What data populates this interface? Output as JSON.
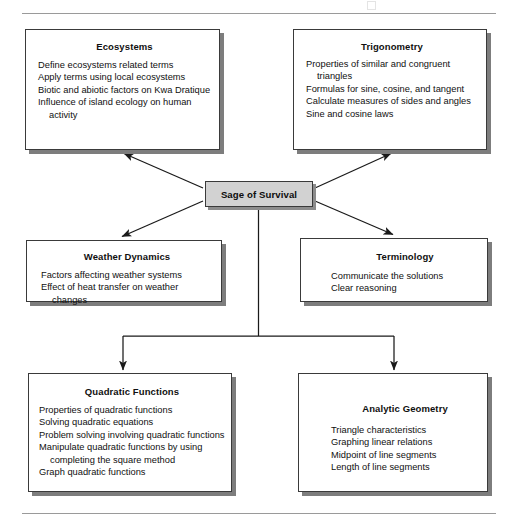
{
  "page": {
    "rules": {
      "top": true,
      "bottom": true
    }
  },
  "diagram": {
    "type": "concept-map",
    "center": {
      "id": "center",
      "label": "Sage of Survival",
      "fill": "#d2d2d2",
      "border": "#3a3a3a"
    },
    "nodes": [
      {
        "id": "ecosystems",
        "title": "Ecosystems",
        "items": [
          "Define ecosystems related terms",
          "Apply terms using local ecosystems",
          "Biotic and abiotic factors on Kwa Dratique",
          "Influence of island ecology on human activity"
        ]
      },
      {
        "id": "trigonometry",
        "title": "Trigonometry",
        "items": [
          "Properties of similar and congruent triangles",
          "Formulas for sine, cosine, and tangent",
          "Calculate measures of sides and angles",
          "Sine and cosine laws"
        ]
      },
      {
        "id": "weather",
        "title": "Weather Dynamics",
        "items": [
          "Factors affecting weather systems",
          "Effect of heat transfer on weather changes"
        ]
      },
      {
        "id": "terminology",
        "title": "Terminology",
        "items": [
          "Communicate the solutions",
          "Clear reasoning"
        ]
      },
      {
        "id": "quadratic",
        "title": "Quadratic Functions",
        "items": [
          "Properties of quadratic functions",
          "Solving quadratic equations",
          "Problem solving involving quadratic functions",
          "Manipulate quadratic functions by using completing the square method",
          "Graph quadratic functions"
        ]
      },
      {
        "id": "analytic",
        "title": "Analytic Geometry",
        "items": [
          "Triangle characteristics",
          "Graphing linear relations",
          "Midpoint of line segments",
          "Length of line segments"
        ]
      }
    ],
    "connections": [
      {
        "from": "center",
        "to": "ecosystems",
        "style": "diagonal-arrow"
      },
      {
        "from": "center",
        "to": "trigonometry",
        "style": "diagonal-arrow"
      },
      {
        "from": "center",
        "to": "weather",
        "style": "diagonal-arrow"
      },
      {
        "from": "center",
        "to": "terminology",
        "style": "diagonal-arrow"
      },
      {
        "from": "center",
        "to": "quadratic",
        "style": "elbow-arrow"
      },
      {
        "from": "center",
        "to": "analytic",
        "style": "elbow-arrow"
      }
    ],
    "colors": {
      "line": "#1a1a1a",
      "box_border": "#3a3a3a",
      "box_fill": "#ffffff",
      "shadow": "#7d7d7d",
      "rule": "#9a9a9a"
    }
  }
}
